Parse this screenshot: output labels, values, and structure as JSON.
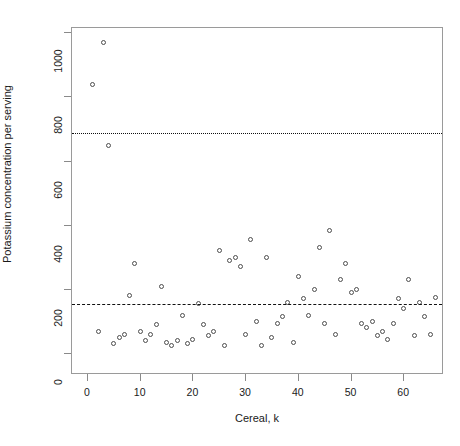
{
  "chart_data": {
    "type": "scatter",
    "title": "",
    "xlabel": "Cereal, k",
    "ylabel": "Potassium concentration per serving",
    "xlim": [
      0,
      68
    ],
    "ylim": [
      0,
      1000
    ],
    "xticks": [
      0,
      10,
      20,
      30,
      40,
      50,
      60
    ],
    "xticklabels": [
      "0",
      "10",
      "20",
      "30",
      "40",
      "50",
      "60"
    ],
    "yticks": [
      0,
      200,
      400,
      600,
      800,
      1000
    ],
    "yticklabels": [
      "0",
      "200",
      "400",
      "600",
      "800",
      "1000"
    ],
    "grid": false,
    "legend": null,
    "marker": "open-circle",
    "reference_lines": [
      {
        "name": "upper-dotted-line",
        "y": 690,
        "style": "dotted"
      },
      {
        "name": "lower-dashed-line",
        "y": 155,
        "style": "dashed"
      }
    ],
    "x": [
      1,
      2,
      3,
      4,
      5,
      6,
      7,
      8,
      9,
      10,
      11,
      12,
      13,
      14,
      15,
      16,
      17,
      18,
      19,
      20,
      21,
      22,
      23,
      24,
      25,
      26,
      27,
      28,
      29,
      30,
      31,
      32,
      33,
      34,
      35,
      36,
      37,
      38,
      39,
      40,
      41,
      42,
      43,
      44,
      45,
      46,
      47,
      48,
      49,
      50,
      51,
      52,
      53,
      54,
      55,
      56,
      57,
      58,
      59,
      60,
      61,
      62,
      63,
      64,
      65,
      66
    ],
    "y": [
      840,
      70,
      970,
      650,
      30,
      50,
      60,
      180,
      280,
      70,
      40,
      60,
      90,
      210,
      35,
      25,
      40,
      120,
      30,
      45,
      155,
      90,
      55,
      70,
      320,
      25,
      290,
      300,
      270,
      60,
      355,
      100,
      25,
      300,
      50,
      95,
      115,
      160,
      35,
      240,
      170,
      120,
      200,
      330,
      95,
      385,
      60,
      230,
      280,
      190,
      200,
      95,
      80,
      100,
      55,
      70,
      45,
      95,
      170,
      140,
      230,
      55,
      160,
      115,
      60,
      175
    ]
  }
}
